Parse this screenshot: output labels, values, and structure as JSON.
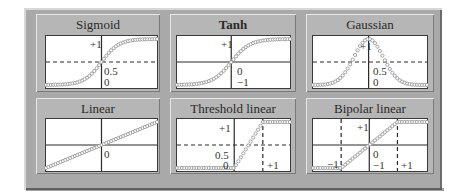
{
  "figure": {
    "panels": [
      {
        "id": "sigmoid",
        "title": "Sigmoid",
        "bold": false,
        "labels": [
          {
            "text": "+1",
            "x": 0.78,
            "y": 0.05,
            "anchor": "right-of-axis-left"
          },
          {
            "text": "0.5",
            "x": 0.5,
            "y": 0.62
          },
          {
            "text": "0",
            "x": 0.5,
            "y": 0.82
          }
        ],
        "curve": "sigmoid",
        "y_range": [
          0,
          1
        ],
        "dashed_h": [
          0.5
        ],
        "dashed_v": []
      },
      {
        "id": "tanh",
        "title": "Tanh",
        "bold": true,
        "labels": [
          {
            "text": "+1"
          },
          {
            "text": "0"
          },
          {
            "text": "−1"
          }
        ],
        "curve": "tanh",
        "y_range": [
          -1,
          1
        ],
        "dashed_h": [],
        "dashed_v": []
      },
      {
        "id": "gaussian",
        "title": "Gaussian",
        "bold": false,
        "labels": [
          {
            "text": "+1"
          },
          {
            "text": "0.5"
          },
          {
            "text": "0"
          }
        ],
        "curve": "gaussian",
        "y_range": [
          0,
          1
        ],
        "dashed_h": [
          0.5
        ],
        "dashed_v": []
      },
      {
        "id": "linear",
        "title": "Linear",
        "bold": false,
        "labels": [
          {
            "text": "0"
          }
        ],
        "curve": "linear",
        "y_range": [
          -1,
          1
        ],
        "dashed_h": [],
        "dashed_v": []
      },
      {
        "id": "threshold-linear",
        "title": "Threshold linear",
        "bold": false,
        "labels": [
          {
            "text": "+1"
          },
          {
            "text": "0.5"
          },
          {
            "text": "0"
          },
          {
            "text": "+1"
          }
        ],
        "curve": "threshold_linear",
        "y_range": [
          0,
          1
        ],
        "dashed_h": [
          0.5
        ],
        "dashed_v": [
          1
        ]
      },
      {
        "id": "bipolar-linear",
        "title": "Bipolar linear",
        "bold": false,
        "labels": [
          {
            "text": "+1"
          },
          {
            "text": "0"
          },
          {
            "text": "−1"
          },
          {
            "text": "−1"
          },
          {
            "text": "+1"
          }
        ],
        "curve": "bipolar_linear",
        "y_range": [
          -1,
          1
        ],
        "dashed_h": [],
        "dashed_v": [
          -1,
          1
        ]
      }
    ]
  },
  "colors": {
    "frame": "#a9a9a9",
    "panel": "#b6b6b6",
    "plot_bg": "#ffffff",
    "axis": "#2a2a2a",
    "marker": "#9a9a9a"
  }
}
